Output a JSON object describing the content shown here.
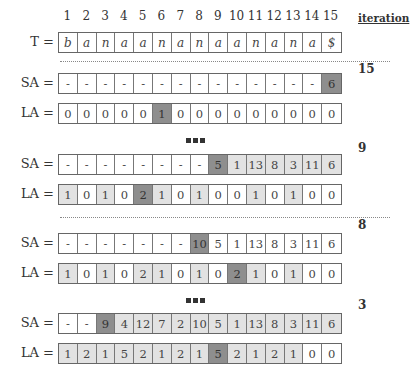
{
  "header": {
    "indices": [
      "1",
      "2",
      "3",
      "4",
      "5",
      "6",
      "7",
      "8",
      "9",
      "10",
      "11",
      "12",
      "13",
      "14",
      "15"
    ],
    "iteration_label": "iteration"
  },
  "text_row": {
    "label": "T =",
    "values": [
      "b",
      "a",
      "n",
      "a",
      "a",
      "n",
      "a",
      "n",
      "a",
      "a",
      "n",
      "a",
      "n",
      "a",
      "$"
    ]
  },
  "blocks": [
    {
      "iteration": "15",
      "sa": {
        "label": "SA =",
        "values": [
          "-",
          "-",
          "-",
          "-",
          "-",
          "-",
          "-",
          "-",
          "-",
          "-",
          "-",
          "-",
          "-",
          "-",
          "6"
        ],
        "shade": [
          "",
          "",
          "",
          "",
          "",
          "",
          "",
          "",
          "",
          "",
          "",
          "",
          "",
          "",
          "dark"
        ]
      },
      "la": {
        "label": "LA =",
        "values": [
          "0",
          "0",
          "0",
          "0",
          "0",
          "1",
          "0",
          "0",
          "0",
          "0",
          "0",
          "0",
          "0",
          "0",
          "0"
        ],
        "shade": [
          "",
          "",
          "",
          "",
          "",
          "dark",
          "",
          "",
          "",
          "",
          "",
          "",
          "",
          "",
          ""
        ]
      }
    },
    {
      "iteration": "9",
      "sa": {
        "label": "SA =",
        "values": [
          "-",
          "-",
          "-",
          "-",
          "-",
          "-",
          "-",
          "-",
          "5",
          "1",
          "13",
          "8",
          "3",
          "11",
          "6"
        ],
        "shade": [
          "",
          "",
          "",
          "",
          "",
          "",
          "",
          "",
          "dark",
          "light",
          "light",
          "light",
          "light",
          "light",
          "light"
        ]
      },
      "la": {
        "label": "LA =",
        "values": [
          "1",
          "0",
          "1",
          "0",
          "2",
          "1",
          "0",
          "1",
          "0",
          "0",
          "1",
          "0",
          "1",
          "0",
          "0"
        ],
        "shade": [
          "light",
          "",
          "light",
          "",
          "dark",
          "light",
          "",
          "light",
          "",
          "",
          "light",
          "",
          "light",
          "",
          ""
        ]
      }
    },
    {
      "iteration": "8",
      "sa": {
        "label": "SA =",
        "values": [
          "-",
          "-",
          "-",
          "-",
          "-",
          "-",
          "-",
          "10",
          "5",
          "1",
          "13",
          "8",
          "3",
          "11",
          "6"
        ],
        "shade": [
          "",
          "",
          "",
          "",
          "",
          "",
          "",
          "dark",
          "",
          "",
          "",
          "",
          "",
          "",
          ""
        ]
      },
      "la": {
        "label": "LA =",
        "values": [
          "1",
          "0",
          "1",
          "0",
          "2",
          "1",
          "0",
          "1",
          "0",
          "2",
          "1",
          "0",
          "1",
          "0",
          "0"
        ],
        "shade": [
          "light",
          "",
          "light",
          "",
          "light",
          "light",
          "",
          "light",
          "",
          "dark",
          "light",
          "",
          "light",
          "",
          ""
        ]
      }
    },
    {
      "iteration": "3",
      "sa": {
        "label": "SA =",
        "values": [
          "-",
          "-",
          "9",
          "4",
          "12",
          "7",
          "2",
          "10",
          "5",
          "1",
          "13",
          "8",
          "3",
          "11",
          "6"
        ],
        "shade": [
          "",
          "",
          "dark",
          "light",
          "light",
          "light",
          "light",
          "light",
          "light",
          "light",
          "light",
          "light",
          "light",
          "light",
          "light"
        ]
      },
      "la": {
        "label": "LA =",
        "values": [
          "1",
          "2",
          "1",
          "5",
          "2",
          "1",
          "2",
          "1",
          "5",
          "2",
          "1",
          "2",
          "1",
          "0",
          "0"
        ],
        "shade": [
          "light",
          "light",
          "light",
          "light",
          "light",
          "light",
          "light",
          "light",
          "dark",
          "light",
          "light",
          "light",
          "light",
          "",
          ""
        ]
      }
    }
  ],
  "separators": [
    "dotted",
    "ellipsis",
    "dotted",
    "ellipsis"
  ],
  "colors": {
    "light_cell": "#e2e2e2",
    "dark_cell": "#8e8e8e",
    "border": "#666666"
  }
}
